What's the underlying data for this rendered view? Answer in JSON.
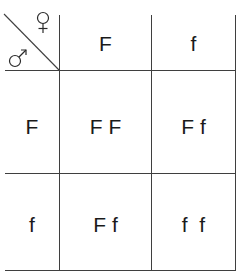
{
  "diagram": {
    "type": "punnett-square",
    "corner": {
      "female_symbol": "♀",
      "male_symbol": "♂",
      "female_label": "female",
      "male_label": "male"
    },
    "columns": [
      "F",
      "f"
    ],
    "rows": [
      "F",
      "f"
    ],
    "cells": [
      [
        "F F",
        "F f"
      ],
      [
        "F f",
        "f  f"
      ]
    ],
    "colors": {
      "line": "#3f3f3f",
      "text": "#1a1a1a",
      "background": "#ffffff"
    }
  }
}
